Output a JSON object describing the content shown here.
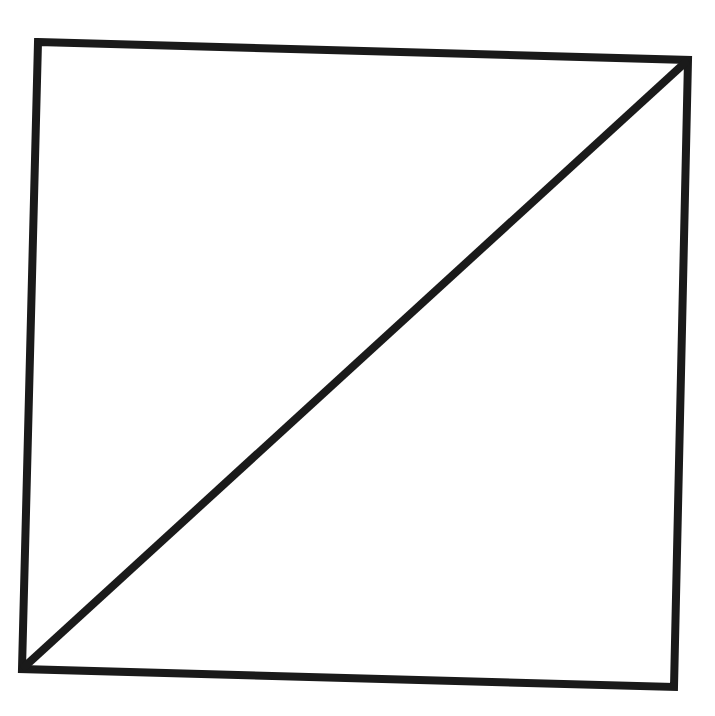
{
  "diagram": {
    "type": "square-with-diagonal",
    "stroke_color": "#1a1a1a",
    "background_color": "#ffffff",
    "stroke_width": 8,
    "square": {
      "corners": {
        "top_left": [
          38,
          42
        ],
        "top_right": [
          688,
          60
        ],
        "bottom_right": [
          674,
          687
        ],
        "bottom_left": [
          22,
          669
        ]
      }
    },
    "diagonal": {
      "from": "bottom_left",
      "to": "top_right",
      "start": [
        22,
        669
      ],
      "end": [
        688,
        60
      ]
    }
  },
  "edge_text": ""
}
